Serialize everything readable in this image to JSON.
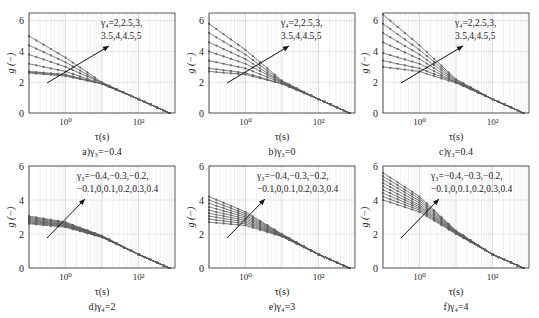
{
  "figure": {
    "panels": [
      {
        "id": "a",
        "caption": "a)γ₃=−0.4",
        "annotation": [
          "γ₄=2,2.5,3,",
          "3.5,4,4.5,5"
        ]
      },
      {
        "id": "b",
        "caption": "b)γ₃=0",
        "annotation": [
          "γ₄=2,2.5,3,",
          "3.5,4,4.5,5"
        ]
      },
      {
        "id": "c",
        "caption": "c)γ₃=0.4",
        "annotation": [
          "γ₄=2,2.5,3,",
          "3.5,4,4.5,5"
        ]
      },
      {
        "id": "d",
        "caption": "d)γ₄=2",
        "annotation": [
          "γ₃=−0.4,−0.3,−0.2,",
          "−0.1,0,0.1,0.2,0.3,0.4"
        ]
      },
      {
        "id": "e",
        "caption": "e)γ₄=3",
        "annotation": [
          "γ₃=−0.4,−0.3,−0.2,",
          "−0.1,0,0.1,0.2,0.3,0.4"
        ]
      },
      {
        "id": "f",
        "caption": "f)γ₄=4",
        "annotation": [
          "γ₃=−0.4,−0.3,−0.2,",
          "−0.1,0,0.1,0.2,0.3,0.4"
        ]
      }
    ],
    "xlabel": "τ(s)",
    "ylabel": "g (−)",
    "yticks": [
      "0",
      "2",
      "4",
      "6"
    ],
    "xticks": [
      "10⁰",
      "10²"
    ]
  },
  "chart_data": [
    {
      "type": "line",
      "title": "a)γ₃=−0.4",
      "xlabel": "τ(s)",
      "ylabel": "g (−)",
      "xscale": "log",
      "xlim": [
        0.1,
        1000
      ],
      "ylim": [
        0,
        6.5
      ],
      "grid": true,
      "annotation": "γ₄=2,2.5,3,3.5,4,4.5,5",
      "x": [
        0.1,
        1,
        10,
        100,
        700
      ],
      "series": [
        {
          "name": "γ₄=2",
          "values": [
            2.6,
            2.4,
            1.9,
            0.9,
            0.0
          ]
        },
        {
          "name": "γ₄=2.5",
          "values": [
            2.65,
            2.45,
            1.9,
            0.9,
            0.0
          ]
        },
        {
          "name": "γ₄=3",
          "values": [
            2.7,
            2.5,
            1.9,
            0.9,
            0.0
          ]
        },
        {
          "name": "γ₄=3.5",
          "values": [
            3.2,
            2.7,
            1.9,
            0.9,
            0.0
          ]
        },
        {
          "name": "γ₄=4",
          "values": [
            3.8,
            3.0,
            1.95,
            0.9,
            0.0
          ]
        },
        {
          "name": "γ₄=4.5",
          "values": [
            4.4,
            3.3,
            1.95,
            0.9,
            0.0
          ]
        },
        {
          "name": "γ₄=5",
          "values": [
            5.0,
            3.6,
            2.0,
            0.9,
            0.0
          ]
        }
      ]
    },
    {
      "type": "line",
      "title": "b)γ₃=0",
      "xlabel": "τ(s)",
      "ylabel": "g (−)",
      "xscale": "log",
      "xlim": [
        0.1,
        1000
      ],
      "ylim": [
        0,
        6.5
      ],
      "grid": true,
      "annotation": "γ₄=2,2.5,3,3.5,4,4.5,5",
      "x": [
        0.1,
        1,
        10,
        100,
        700
      ],
      "series": [
        {
          "name": "γ₄=2",
          "values": [
            2.7,
            2.5,
            1.9,
            0.9,
            0.0
          ]
        },
        {
          "name": "γ₄=2.5",
          "values": [
            2.9,
            2.6,
            1.9,
            0.9,
            0.0
          ]
        },
        {
          "name": "γ₄=3",
          "values": [
            3.4,
            2.9,
            1.95,
            0.9,
            0.0
          ]
        },
        {
          "name": "γ₄=3.5",
          "values": [
            4.0,
            3.2,
            2.0,
            0.9,
            0.0
          ]
        },
        {
          "name": "γ₄=4",
          "values": [
            4.6,
            3.5,
            2.0,
            0.9,
            0.0
          ]
        },
        {
          "name": "γ₄=4.5",
          "values": [
            5.2,
            3.8,
            2.05,
            0.9,
            0.0
          ]
        },
        {
          "name": "γ₄=5",
          "values": [
            5.8,
            4.1,
            2.1,
            0.9,
            0.0
          ]
        }
      ]
    },
    {
      "type": "line",
      "title": "c)γ₃=0.4",
      "xlabel": "τ(s)",
      "ylabel": "g (−)",
      "xscale": "log",
      "xlim": [
        0.1,
        1000
      ],
      "ylim": [
        0,
        6.5
      ],
      "grid": true,
      "annotation": "γ₄=2,2.5,3,3.5,4,4.5,5",
      "x": [
        0.1,
        1,
        10,
        100,
        700
      ],
      "series": [
        {
          "name": "γ₄=2",
          "values": [
            3.0,
            2.7,
            1.95,
            0.9,
            0.0
          ]
        },
        {
          "name": "γ₄=2.5",
          "values": [
            3.4,
            2.9,
            2.0,
            0.9,
            0.0
          ]
        },
        {
          "name": "γ₄=3",
          "values": [
            3.9,
            3.2,
            2.0,
            0.9,
            0.0
          ]
        },
        {
          "name": "γ₄=3.5",
          "values": [
            4.6,
            3.5,
            2.05,
            0.9,
            0.0
          ]
        },
        {
          "name": "γ₄=4",
          "values": [
            5.2,
            3.8,
            2.1,
            0.9,
            0.0
          ]
        },
        {
          "name": "γ₄=4.5",
          "values": [
            5.8,
            4.1,
            2.15,
            0.9,
            0.0
          ]
        },
        {
          "name": "γ₄=5",
          "values": [
            6.4,
            4.4,
            2.2,
            0.9,
            0.0
          ]
        }
      ]
    },
    {
      "type": "line",
      "title": "d)γ₄=2",
      "xlabel": "τ(s)",
      "ylabel": "g (−)",
      "xscale": "log",
      "xlim": [
        0.1,
        1000
      ],
      "ylim": [
        0,
        6
      ],
      "grid": true,
      "annotation": "γ₃=−0.4,−0.3,−0.2,−0.1,0,0.1,0.2,0.3,0.4",
      "x": [
        0.1,
        1,
        10,
        100,
        700
      ],
      "series": [
        {
          "name": "γ₃=−0.4",
          "values": [
            2.6,
            2.4,
            1.8,
            0.8,
            0.0
          ]
        },
        {
          "name": "γ₃=0",
          "values": [
            2.8,
            2.55,
            1.85,
            0.8,
            0.0
          ]
        },
        {
          "name": "γ₃=0.4",
          "values": [
            3.05,
            2.7,
            1.9,
            0.8,
            0.0
          ]
        }
      ]
    },
    {
      "type": "line",
      "title": "e)γ₄=3",
      "xlabel": "τ(s)",
      "ylabel": "g (−)",
      "xscale": "log",
      "xlim": [
        0.1,
        1000
      ],
      "ylim": [
        0,
        6
      ],
      "grid": true,
      "annotation": "γ₃=−0.4,−0.3,−0.2,−0.1,0,0.1,0.2,0.3,0.4",
      "x": [
        0.1,
        1,
        10,
        100,
        700
      ],
      "series": [
        {
          "name": "γ₃=−0.4",
          "values": [
            2.7,
            2.5,
            1.85,
            0.8,
            0.0
          ]
        },
        {
          "name": "γ₃=0",
          "values": [
            3.4,
            2.9,
            1.9,
            0.8,
            0.0
          ]
        },
        {
          "name": "γ₃=0.4",
          "values": [
            4.2,
            3.3,
            2.0,
            0.8,
            0.0
          ]
        }
      ]
    },
    {
      "type": "line",
      "title": "f)γ₄=4",
      "xlabel": "τ(s)",
      "ylabel": "g (−)",
      "xscale": "log",
      "xlim": [
        0.1,
        1000
      ],
      "ylim": [
        0,
        6
      ],
      "grid": true,
      "annotation": "γ₃=−0.4,−0.3,−0.2,−0.1,0,0.1,0.2,0.3,0.4",
      "x": [
        0.1,
        1,
        10,
        100,
        700
      ],
      "series": [
        {
          "name": "γ₃=−0.4",
          "values": [
            4.0,
            3.3,
            2.0,
            0.8,
            0.0
          ]
        },
        {
          "name": "γ₃=0",
          "values": [
            4.8,
            3.7,
            2.1,
            0.8,
            0.0
          ]
        },
        {
          "name": "γ₃=0.4",
          "values": [
            5.6,
            4.2,
            2.2,
            0.8,
            0.0
          ]
        }
      ]
    }
  ]
}
